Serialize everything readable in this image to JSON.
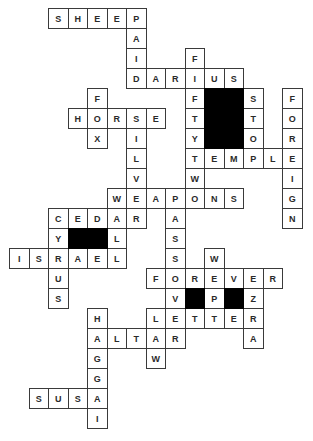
{
  "puzzle": {
    "grid": {
      "origin_x": 9,
      "origin_y": 8,
      "cell_w": 19.5,
      "cell_h": 20,
      "columns": 15,
      "rows": 21
    },
    "colors": {
      "cell_border": "#3a3a3a",
      "letter": "#2a2a2a",
      "block": "#000000",
      "background": "#ffffff"
    },
    "across": [
      {
        "word": "SHEEP",
        "row": 0,
        "col": 2
      },
      {
        "word": "DARIUS",
        "row": 3,
        "col": 6
      },
      {
        "word": "HORSE",
        "row": 5,
        "col": 3
      },
      {
        "word": "TEMPLE",
        "row": 7,
        "col": 9
      },
      {
        "word": "WEAPONS",
        "row": 9,
        "col": 5
      },
      {
        "word": "CEDAR",
        "row": 10,
        "col": 2
      },
      {
        "word": "ISRAEL",
        "row": 12,
        "col": 0
      },
      {
        "word": "FOREVER",
        "row": 13,
        "col": 7
      },
      {
        "word": "LETTER",
        "row": 15,
        "col": 7
      },
      {
        "word": "ALTAR",
        "row": 16,
        "col": 4
      },
      {
        "word": "SUSA",
        "row": 19,
        "col": 1
      }
    ],
    "down": [
      {
        "word": "PAID",
        "row": 0,
        "col": 6
      },
      {
        "word": "FIFTYTWO",
        "row": 2,
        "col": 9
      },
      {
        "word": "FOX",
        "row": 4,
        "col": 4
      },
      {
        "word": "SILVER",
        "row": 5,
        "col": 6
      },
      {
        "word": "STOP",
        "row": 4,
        "col": 12
      },
      {
        "word": "FOREIGN",
        "row": 4,
        "col": 14
      },
      {
        "word": "WALL",
        "row": 9,
        "col": 5
      },
      {
        "word": "PASSOVER",
        "row": 9,
        "col": 8
      },
      {
        "word": "CYRUS",
        "row": 10,
        "col": 2
      },
      {
        "word": "WEPT",
        "row": 12,
        "col": 10
      },
      {
        "word": "EZRA",
        "row": 13,
        "col": 12
      },
      {
        "word": "HAGGAI",
        "row": 15,
        "col": 4
      },
      {
        "word": "LAW",
        "row": 15,
        "col": 7
      }
    ],
    "blocks": [
      {
        "row": 4,
        "col": 10,
        "rows": 3,
        "cols": 2
      },
      {
        "row": 11,
        "col": 3,
        "rows": 1,
        "cols": 2
      },
      {
        "row": 14,
        "col": 9,
        "rows": 1,
        "cols": 1
      },
      {
        "row": 14,
        "col": 11,
        "rows": 1,
        "cols": 1
      }
    ]
  }
}
